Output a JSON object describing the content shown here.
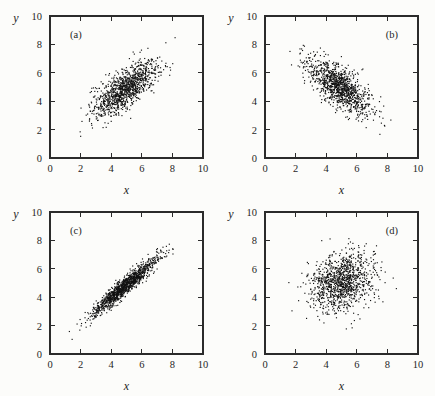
{
  "figure": {
    "background_color": "#fcfcfa",
    "point_color": "#111111",
    "axis_color": "#2b2b2b",
    "layout": "2x2 grid of scatter plots"
  },
  "axes": {
    "xlabel": "x",
    "ylabel": "y",
    "xlim": [
      0,
      10
    ],
    "ylim": [
      0,
      10
    ],
    "xticks": [
      0,
      2,
      4,
      6,
      8,
      10
    ],
    "yticks": [
      0,
      2,
      4,
      6,
      8,
      10
    ],
    "xtick_labels": [
      "0",
      "2",
      "4",
      "6",
      "8",
      "10"
    ],
    "ytick_labels": [
      "0",
      "2",
      "4",
      "6",
      "8",
      "10"
    ],
    "tick_direction": "in",
    "grid": false
  },
  "chart_data": [
    {
      "type": "scatter",
      "panel": "(a)",
      "label_position": "top-left",
      "title": "",
      "xlabel": "x",
      "ylabel": "y",
      "xlim": [
        0,
        10
      ],
      "ylim": [
        0,
        10
      ],
      "n_points": 1100,
      "correlation": 0.72,
      "mean_x": 4.9,
      "mean_y": 4.9,
      "sd_x": 1.05,
      "sd_y": 0.95,
      "seed": 11,
      "description": "Elongated positive-slope elliptical cloud; moderate-to-strong positive correlation"
    },
    {
      "type": "scatter",
      "panel": "(b)",
      "label_position": "top-right",
      "title": "",
      "xlabel": "x",
      "ylabel": "y",
      "xlim": [
        0,
        10
      ],
      "ylim": [
        0,
        10
      ],
      "n_points": 1100,
      "correlation": -0.7,
      "mean_x": 4.85,
      "mean_y": 5.0,
      "sd_x": 1.0,
      "sd_y": 0.95,
      "seed": 23,
      "description": "Elongated negative-slope elliptical cloud; moderate-to-strong negative correlation"
    },
    {
      "type": "scatter",
      "panel": "(c)",
      "label_position": "top-left",
      "title": "",
      "xlabel": "x",
      "ylabel": "y",
      "xlim": [
        0,
        10
      ],
      "ylim": [
        0,
        10
      ],
      "n_points": 1200,
      "correlation": 0.95,
      "mean_x": 4.85,
      "mean_y": 4.8,
      "sd_x": 1.05,
      "sd_y": 1.0,
      "seed": 37,
      "description": "Very tight positive band; near-linear, strong positive correlation"
    },
    {
      "type": "scatter",
      "panel": "(d)",
      "label_position": "top-right",
      "title": "",
      "xlabel": "x",
      "ylabel": "y",
      "xlim": [
        0,
        10
      ],
      "ylim": [
        0,
        10
      ],
      "n_points": 1100,
      "correlation": 0.2,
      "mean_x": 5.0,
      "mean_y": 5.1,
      "sd_x": 1.05,
      "sd_y": 1.0,
      "seed": 53,
      "description": "Roughly circular cloud with slight positive tilt; weak correlation"
    }
  ]
}
